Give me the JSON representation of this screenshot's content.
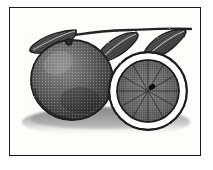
{
  "artwork": {
    "title": "Orange — whole fruit and cut half with leaves",
    "medium": "engraving",
    "style": "vintage botanical line engraving, stipple and hatching",
    "subject": "citrus orange",
    "background_color": "#ffffff",
    "ink_color": "#2b2b2b",
    "frame": {
      "visible": true,
      "color": "#1a1a1a",
      "thickness_px": 1.6,
      "x": 9,
      "y": 7,
      "width": 192,
      "height": 149
    },
    "elements": [
      {
        "name": "whole-orange",
        "label": "Whole orange fruit",
        "shape": "sphere",
        "center_x": 72,
        "center_y": 80,
        "radius_x": 41,
        "radius_y": 40,
        "tone": "dark mottled gray",
        "texture": "stippled peel with highlight speckles"
      },
      {
        "name": "halved-orange",
        "label": "Halved orange showing pulp",
        "shape": "circle",
        "center_x": 148,
        "center_y": 91,
        "radius_x": 39,
        "radius_y": 38,
        "rind_color": "#ffffff",
        "rind_thickness_px": 7,
        "pulp_tone": "medium gray",
        "texture": "radiating segment lines with dark core"
      },
      {
        "name": "leaf-left",
        "label": "Left leaf",
        "tip_x": 31,
        "tip_y": 47,
        "base_x": 74,
        "base_y": 30,
        "texture": "diagonal hatching"
      },
      {
        "name": "leaf-center",
        "label": "Center leaf",
        "tip_x": 97,
        "tip_y": 60,
        "base_x": 137,
        "base_y": 33,
        "texture": "diagonal hatching"
      },
      {
        "name": "leaf-right",
        "label": "Right leaf",
        "tip_x": 142,
        "tip_y": 57,
        "base_x": 184,
        "base_y": 31,
        "texture": "diagonal hatching"
      },
      {
        "name": "branch-stem",
        "label": "Branch with stem",
        "start_x": 36,
        "start_y": 44,
        "end_x": 190,
        "end_y": 29
      },
      {
        "name": "ground-shadow",
        "label": "Cast shadow beneath fruit",
        "center_x": 106,
        "center_y": 124,
        "width": 168,
        "height": 30,
        "tone": "soft gray gradient"
      }
    ]
  }
}
